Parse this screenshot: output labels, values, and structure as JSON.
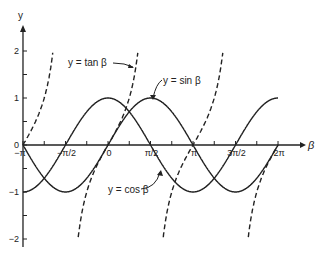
{
  "chart_data": {
    "type": "line",
    "title": "",
    "xlabel": "β",
    "ylabel": "y",
    "xlim": [
      -3.14159,
      6.28318
    ],
    "ylim": [
      -2,
      2
    ],
    "grid": false,
    "x_ticks": [
      {
        "value": -3.14159,
        "label": "−π"
      },
      {
        "value": -1.5708,
        "label": "−π/2"
      },
      {
        "value": 0,
        "label": "0"
      },
      {
        "value": 1.5708,
        "label": "π/2"
      },
      {
        "value": 3.14159,
        "label": "π"
      },
      {
        "value": 4.7124,
        "label": "3π/2"
      },
      {
        "value": 6.28318,
        "label": "2π"
      }
    ],
    "y_ticks": [
      {
        "value": 2,
        "label": "2"
      },
      {
        "value": 1,
        "label": "1"
      },
      {
        "value": 0,
        "label": "0"
      },
      {
        "value": -1,
        "label": "−1"
      },
      {
        "value": -2,
        "label": "−2"
      }
    ],
    "series": [
      {
        "name": "y = sin β",
        "style": "solid",
        "function": "sin",
        "x_range": [
          -3.14159,
          6.28318
        ]
      },
      {
        "name": "y = cos β",
        "style": "solid",
        "function": "cos",
        "x_range": [
          -3.14159,
          6.28318
        ]
      },
      {
        "name": "y = tan β",
        "style": "dashed",
        "function": "tan",
        "x_range": [
          -3.14159,
          6.28318
        ],
        "y_clip": [
          -2,
          2
        ]
      }
    ],
    "annotations": [
      {
        "text": "y = tan β",
        "arrow_to_series": "tan"
      },
      {
        "text": "y = sin β",
        "arrow_to_series": "sin"
      },
      {
        "text": "y = cos β",
        "arrow_to_series": "cos"
      }
    ]
  },
  "labels": {
    "y_axis": "y",
    "x_axis": "β",
    "tan": "y = tan β",
    "sin": "y = sin β",
    "cos": "y = cos β"
  }
}
